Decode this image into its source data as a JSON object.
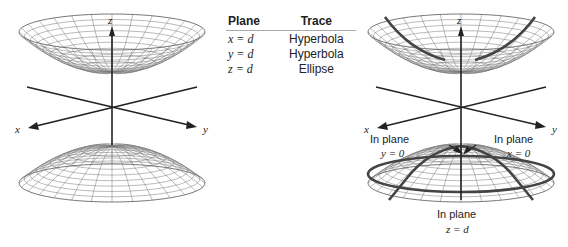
{
  "table": {
    "headers": [
      "Plane",
      "Trace"
    ],
    "rows": [
      {
        "plane": "x = d",
        "trace": "Hyperbola"
      },
      {
        "plane": "y = d",
        "trace": "Hyperbola"
      },
      {
        "plane": "z = d",
        "trace": "Ellipse"
      }
    ]
  },
  "figures": {
    "left": {
      "axes": {
        "x": "x",
        "y": "y",
        "z": "z"
      }
    },
    "right": {
      "axes": {
        "x": "x",
        "y": "y",
        "z": "z"
      },
      "annotations": {
        "y0": {
          "line1": "In plane",
          "line2": "y = 0"
        },
        "x0": {
          "line1": "In plane",
          "line2": "x = 0"
        },
        "zd": {
          "line1": "In plane",
          "line2": "z = d"
        }
      }
    }
  },
  "colors": {
    "mesh": "#777777",
    "axis": "#222222",
    "trace": "#444444"
  }
}
